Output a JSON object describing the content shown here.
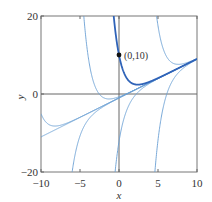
{
  "chart_data": {
    "type": "line",
    "title": "",
    "xlabel": "x",
    "ylabel": "y",
    "xlim": [
      -10,
      10
    ],
    "ylim": [
      -20,
      20
    ],
    "xticks": [
      -10,
      -5,
      0,
      5,
      10
    ],
    "yticks": [
      -20,
      0,
      20
    ],
    "xtick_labels": [
      "−10",
      "−5",
      "0",
      "5",
      "10"
    ],
    "ytick_labels": [
      "−20",
      "0",
      "20"
    ],
    "grid": false,
    "zero_lines": true,
    "family_formula": "y = x - 1 + C*exp(-x)",
    "series": [
      {
        "name": "C=0 (asymptote y=x-1)",
        "C": 0,
        "highlight": false
      },
      {
        "name": "C=0.00027",
        "C": 0.00027,
        "highlight": false
      },
      {
        "name": "C=0.28",
        "C": 0.28,
        "highlight": false
      },
      {
        "name": "C=2000",
        "C": 2000,
        "highlight": false
      },
      {
        "name": "C=-0.032",
        "C": -0.032,
        "highlight": false
      },
      {
        "name": "C=-11.2",
        "C": -11.2,
        "highlight": false
      },
      {
        "name": "C=-2350",
        "C": -2350,
        "highlight": false
      },
      {
        "name": "Solution through (0,10)",
        "C": 11,
        "highlight": true
      }
    ],
    "annotations": [
      {
        "text": "(0,10)",
        "x": 0,
        "y": 10,
        "marker": "dot"
      }
    ],
    "colors": {
      "curve": "#6a9fd4",
      "highlight": "#2f63b8",
      "axes": "#666666",
      "marker": "#111111"
    }
  }
}
